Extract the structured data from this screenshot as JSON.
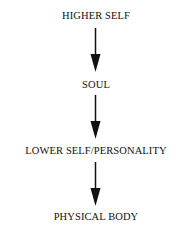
{
  "diagram": {
    "type": "flow",
    "direction": "top-to-bottom",
    "nodes": [
      {
        "id": "higher-self",
        "label": "HIGHER SELF"
      },
      {
        "id": "soul",
        "label": "SOUL"
      },
      {
        "id": "lower-self",
        "label": "LOWER SELF/PERSONALITY"
      },
      {
        "id": "physical-body",
        "label": "PHYSICAL BODY"
      }
    ],
    "edges": [
      {
        "from": "higher-self",
        "to": "soul"
      },
      {
        "from": "soul",
        "to": "lower-self"
      },
      {
        "from": "lower-self",
        "to": "physical-body"
      }
    ]
  }
}
